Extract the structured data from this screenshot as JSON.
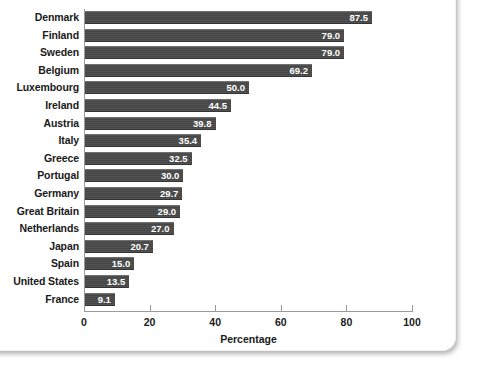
{
  "card": {
    "background": "#ffffff",
    "border_radius_px": 14
  },
  "chart_data": {
    "type": "bar",
    "orientation": "horizontal",
    "title": "",
    "subtitle": "",
    "xlabel": "Percentage",
    "ylabel": "",
    "xlim": [
      0,
      100
    ],
    "xticks": [
      0,
      20,
      40,
      60,
      80,
      100
    ],
    "xtick_labels": [
      "0",
      "20",
      "40",
      "60",
      "80",
      "100"
    ],
    "grid": false,
    "legend": false,
    "legend_position": "none",
    "bar_color": "#4a4a4a",
    "value_label_color": "#ffffff",
    "axis_color": "#9a9a9a",
    "text_color": "#1a1a1a",
    "categories": [
      "Denmark",
      "Finland",
      "Sweden",
      "Belgium",
      "Luxembourg",
      "Ireland",
      "Austria",
      "Italy",
      "Greece",
      "Portugal",
      "Germany",
      "Great Britain",
      "Netherlands",
      "Japan",
      "Spain",
      "United States",
      "France"
    ],
    "values": [
      87.5,
      79.0,
      79.0,
      69.2,
      50.0,
      44.5,
      39.8,
      35.4,
      32.5,
      30.0,
      29.7,
      29.0,
      27.0,
      20.7,
      15.0,
      13.5,
      9.1
    ],
    "value_labels": [
      "87.5",
      "79.0",
      "79.0",
      "69.2",
      "50.0",
      "44.5",
      "39.8",
      "35.4",
      "32.5",
      "30.0",
      "29.7",
      "29.0",
      "27.0",
      "20.7",
      "15.0",
      "13.5",
      "9.1"
    ]
  }
}
